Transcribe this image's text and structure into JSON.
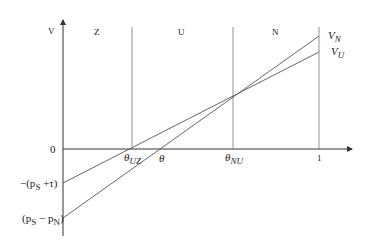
{
  "diagram": {
    "y_axis_label": "V",
    "x_axis_label": "θ",
    "zero_label": "0",
    "one_label": "1",
    "regions": [
      "Z",
      "U",
      "N"
    ],
    "thresholds": [
      {
        "symbol": "θ",
        "sub": "UZ"
      },
      {
        "symbol": "θ",
        "sub": "NU"
      }
    ],
    "lines": [
      {
        "name": "V",
        "sub": "N",
        "intercept_label": "(p_S − p_N)",
        "intercept_main": "(p",
        "intercept_sub1": "S",
        "intercept_mid": " − p",
        "intercept_sub2": "N",
        "intercept_end": ")"
      },
      {
        "name": "V",
        "sub": "U",
        "intercept_label": "−(p_S + τ)",
        "intercept_main": "−(p",
        "intercept_sub1": "S",
        "intercept_mid": " +τ)"
      }
    ],
    "colors": {
      "axis": "#333333",
      "line": "#555555",
      "text": "#222222"
    }
  }
}
